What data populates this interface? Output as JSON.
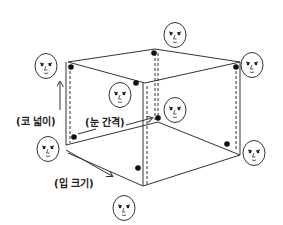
{
  "diagram": {
    "type": "3d-cube-face-parameter-space",
    "axes": [
      {
        "id": "nose",
        "label": "(코 넓이)",
        "meaning": "nose width"
      },
      {
        "id": "eyes",
        "label": "(눈 간격)",
        "meaning": "eye spacing"
      },
      {
        "id": "mouth",
        "label": "(입 크기)",
        "meaning": "mouth size"
      }
    ],
    "colors": {
      "line": "#333333",
      "dot": "#111111",
      "background": "#ffffff"
    },
    "faces": [
      {
        "id": "face-top-left",
        "cx": 46,
        "cy": 66
      },
      {
        "id": "face-top-back",
        "cx": 175,
        "cy": 35
      },
      {
        "id": "face-top-right",
        "cx": 252,
        "cy": 65
      },
      {
        "id": "face-front-center",
        "cx": 120,
        "cy": 95
      },
      {
        "id": "face-center-back",
        "cx": 175,
        "cy": 110
      },
      {
        "id": "face-origin",
        "cx": 48,
        "cy": 149
      },
      {
        "id": "face-bottom-front",
        "cx": 124,
        "cy": 208
      },
      {
        "id": "face-bottom-right",
        "cx": 254,
        "cy": 153
      }
    ]
  }
}
